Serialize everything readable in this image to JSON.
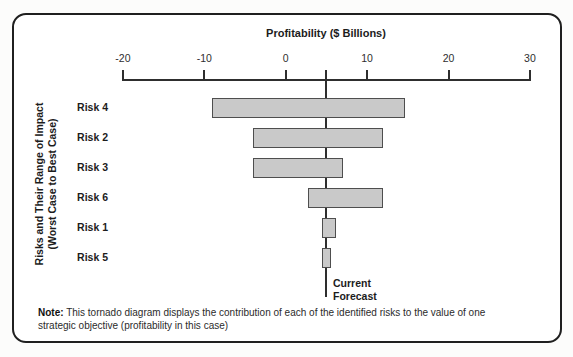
{
  "chart_data": {
    "type": "bar",
    "variant": "tornado",
    "title": "Profitability ($ Billions)",
    "axis": {
      "min": -20,
      "max": 30,
      "ticks": [
        -20,
        -10,
        0,
        10,
        20,
        30
      ],
      "position": "top"
    },
    "ylabel_line1": "Risks and Their Range of Impact",
    "ylabel_line2": "(Worst Case to Best Case)",
    "rows": [
      {
        "label": "Risk 4",
        "worst_case": -9,
        "best_case": 14.7
      },
      {
        "label": "Risk 2",
        "worst_case": -4,
        "best_case": 12
      },
      {
        "label": "Risk 3",
        "worst_case": -4,
        "best_case": 7
      },
      {
        "label": "Risk 6",
        "worst_case": 2.7,
        "best_case": 12
      },
      {
        "label": "Risk 1",
        "worst_case": 4.4,
        "best_case": 6.2
      },
      {
        "label": "Risk 5",
        "worst_case": 4.5,
        "best_case": 5.6
      }
    ],
    "current_forecast": {
      "value": 5,
      "label_line1": "Current",
      "label_line2": "Forecast"
    },
    "bar_fill": "#c9c9c9",
    "bar_border": "#4e4e4e",
    "line_color": "#2e2e2e"
  },
  "note": {
    "label": "Note:",
    "line1": " This tornado diagram displays the contribution of each of the identified risks to the value of one",
    "line2": "strategic objective (profitability in this case)"
  }
}
